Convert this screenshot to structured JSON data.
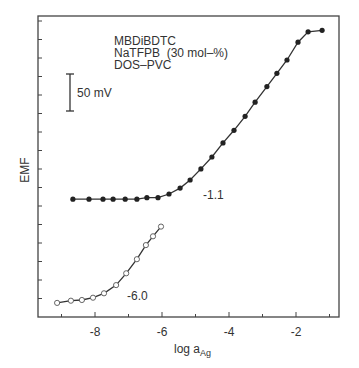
{
  "chart_data": {
    "type": "line",
    "title": "",
    "xlabel": "log a",
    "xlabel_subscript": "Ag",
    "ylabel": "EMF",
    "xlim": [
      -9.7,
      -0.7
    ],
    "x_ticks": [
      -8,
      -6,
      -4,
      -2
    ],
    "x_tick_labels": [
      "-8",
      "-6",
      "-4",
      "-2"
    ],
    "y_tick_labels": [],
    "grid": false,
    "annotations": {
      "legend_lines": [
        "MBDiBDTC",
        "NaTFPB  (30 mol–%)",
        "DOS–PVC"
      ],
      "scale_bar_label": "50 mV",
      "scale_bar_mV": 50
    },
    "series": [
      {
        "name": "-1.1",
        "marker": "filled-circle",
        "x": [
          -8.66,
          -8.18,
          -7.76,
          -7.46,
          -7.1,
          -6.75,
          -6.45,
          -6.12,
          -5.79,
          -5.46,
          -5.16,
          -4.84,
          -4.51,
          -4.18,
          -3.85,
          -3.52,
          -3.22,
          -2.87,
          -2.57,
          -2.27,
          -1.94,
          -1.64,
          -1.22
        ],
        "y": [
          159,
          159,
          159,
          159,
          159,
          159,
          161,
          161,
          166,
          174,
          185,
          200,
          216,
          235,
          252,
          271,
          290,
          311,
          329,
          347,
          371,
          385,
          387
        ]
      },
      {
        "name": "-6.0",
        "marker": "open-circle",
        "x": [
          -9.13,
          -8.72,
          -8.39,
          -8.06,
          -7.73,
          -7.37,
          -7.07,
          -6.75,
          -6.48,
          -6.27,
          -6.03
        ],
        "y": [
          19,
          22,
          23,
          26,
          32,
          43,
          59,
          78,
          97,
          109,
          122
        ]
      }
    ],
    "y_units_note": "relative EMF in mV (read via 50 mV scale bar)"
  }
}
